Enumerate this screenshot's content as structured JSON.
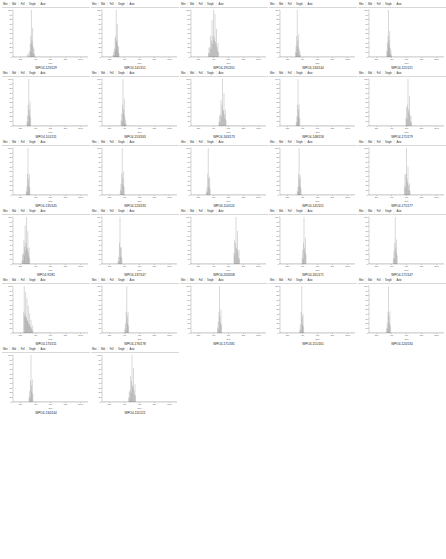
{
  "page": {
    "layout": "grid of mass-spectrum panels, 5 columns",
    "panel_count": 27
  },
  "toolbar": {
    "items": [
      "Mini",
      "Mid",
      "Full",
      "Single",
      "Auto"
    ],
    "separator": "|"
  },
  "axis": {
    "xlabel": "m/z",
    "ylabel": "",
    "ticks_x": [
      "200",
      "400",
      "600",
      "800",
      "1000"
    ]
  },
  "chart_data": [
    {
      "type": "line",
      "title": "WPO4-123/129",
      "xlabel": "m/z",
      "ylabel": "Intensity",
      "xlim": [
        100,
        1100
      ],
      "ylim": [
        0,
        100
      ],
      "yticks": [
        0,
        10,
        20,
        30,
        40,
        50,
        60,
        70,
        80,
        90,
        100
      ],
      "peaks": [
        {
          "x": 345,
          "y": 100
        },
        {
          "x": 362,
          "y": 62
        },
        {
          "x": 330,
          "y": 28
        },
        {
          "x": 380,
          "y": 18
        },
        {
          "x": 300,
          "y": 9
        }
      ]
    },
    {
      "type": "line",
      "title": "WPO4-141/151",
      "xlabel": "m/z",
      "ylabel": "Intensity",
      "xlim": [
        100,
        1100
      ],
      "ylim": [
        0,
        100
      ],
      "peaks": [
        {
          "x": 290,
          "y": 100
        },
        {
          "x": 305,
          "y": 70
        },
        {
          "x": 275,
          "y": 40
        },
        {
          "x": 320,
          "y": 22
        },
        {
          "x": 255,
          "y": 11
        }
      ]
    },
    {
      "type": "line",
      "title": "WPO4-191/201",
      "xlabel": "m/z",
      "ylabel": "Intensity",
      "xlim": [
        100,
        1100
      ],
      "ylim": [
        0,
        100
      ],
      "peaks": [
        {
          "x": 400,
          "y": 100
        },
        {
          "x": 420,
          "y": 92
        },
        {
          "x": 380,
          "y": 78
        },
        {
          "x": 440,
          "y": 60
        },
        {
          "x": 360,
          "y": 45
        },
        {
          "x": 460,
          "y": 30
        },
        {
          "x": 340,
          "y": 20
        }
      ]
    },
    {
      "type": "line",
      "title": "WPO4-134/144",
      "xlabel": "m/z",
      "ylabel": "Intensity",
      "xlim": [
        100,
        1100
      ],
      "ylim": [
        0,
        100
      ],
      "peaks": [
        {
          "x": 330,
          "y": 100
        },
        {
          "x": 348,
          "y": 48
        },
        {
          "x": 315,
          "y": 25
        },
        {
          "x": 365,
          "y": 12
        }
      ]
    },
    {
      "type": "line",
      "title": "WPO4-121/121",
      "xlabel": "m/z",
      "ylabel": "Intensity",
      "xlim": [
        100,
        1100
      ],
      "ylim": [
        0,
        100
      ],
      "peaks": [
        {
          "x": 360,
          "y": 100
        },
        {
          "x": 375,
          "y": 55
        },
        {
          "x": 345,
          "y": 30
        },
        {
          "x": 392,
          "y": 14
        }
      ]
    },
    {
      "type": "line",
      "title": "WPO4-101/111",
      "xlabel": "m/z",
      "ylabel": "Intensity",
      "xlim": [
        100,
        1100
      ],
      "ylim": [
        0,
        100
      ],
      "peaks": [
        {
          "x": 310,
          "y": 100
        },
        {
          "x": 328,
          "y": 52
        },
        {
          "x": 295,
          "y": 22
        }
      ]
    },
    {
      "type": "line",
      "title": "WPO4-153/163",
      "xlabel": "m/z",
      "ylabel": "Intensity",
      "xlim": [
        100,
        1100
      ],
      "ylim": [
        0,
        100
      ],
      "peaks": [
        {
          "x": 380,
          "y": 100
        },
        {
          "x": 398,
          "y": 58
        },
        {
          "x": 362,
          "y": 26
        },
        {
          "x": 415,
          "y": 12
        }
      ]
    },
    {
      "type": "line",
      "title": "WPO4-163/173",
      "xlabel": "m/z",
      "ylabel": "Intensity",
      "xlim": [
        100,
        1100
      ],
      "ylim": [
        0,
        100
      ],
      "peaks": [
        {
          "x": 520,
          "y": 100
        },
        {
          "x": 540,
          "y": 70
        },
        {
          "x": 500,
          "y": 55
        },
        {
          "x": 560,
          "y": 35
        },
        {
          "x": 480,
          "y": 22
        }
      ]
    },
    {
      "type": "line",
      "title": "WPO4-148/158",
      "xlabel": "m/z",
      "ylabel": "Intensity",
      "xlim": [
        100,
        1100
      ],
      "ylim": [
        0,
        100
      ],
      "peaks": [
        {
          "x": 340,
          "y": 100
        },
        {
          "x": 356,
          "y": 46
        },
        {
          "x": 324,
          "y": 20
        }
      ]
    },
    {
      "type": "line",
      "title": "WPO4-171/179",
      "xlabel": "m/z",
      "ylabel": "Intensity",
      "xlim": [
        100,
        1100
      ],
      "ylim": [
        0,
        100
      ],
      "peaks": [
        {
          "x": 620,
          "y": 100
        },
        {
          "x": 640,
          "y": 64
        },
        {
          "x": 600,
          "y": 40
        },
        {
          "x": 660,
          "y": 22
        }
      ]
    },
    {
      "type": "line",
      "title": "WPO4-135/145",
      "xlabel": "m/z",
      "ylabel": "Intensity",
      "xlim": [
        100,
        1100
      ],
      "ylim": [
        0,
        100
      ],
      "peaks": [
        {
          "x": 300,
          "y": 100
        },
        {
          "x": 318,
          "y": 44
        },
        {
          "x": 285,
          "y": 18
        }
      ]
    },
    {
      "type": "line",
      "title": "WPO4-123/133",
      "xlabel": "m/z",
      "ylabel": "Intensity",
      "xlim": [
        100,
        1100
      ],
      "ylim": [
        0,
        100
      ],
      "peaks": [
        {
          "x": 370,
          "y": 100
        },
        {
          "x": 388,
          "y": 50
        },
        {
          "x": 352,
          "y": 24
        }
      ]
    },
    {
      "type": "line",
      "title": "WPO4-114/124",
      "xlabel": "m/z",
      "ylabel": "Intensity",
      "xlim": [
        100,
        1100
      ],
      "ylim": [
        0,
        100
      ],
      "peaks": [
        {
          "x": 330,
          "y": 100
        },
        {
          "x": 348,
          "y": 38
        },
        {
          "x": 312,
          "y": 16
        }
      ]
    },
    {
      "type": "line",
      "title": "WPO4-141/151",
      "xlabel": "m/z",
      "ylabel": "Intensity",
      "xlim": [
        100,
        1100
      ],
      "ylim": [
        0,
        100
      ],
      "peaks": [
        {
          "x": 355,
          "y": 100
        },
        {
          "x": 372,
          "y": 42
        },
        {
          "x": 338,
          "y": 18
        }
      ]
    },
    {
      "type": "line",
      "title": "WPO4-171/177",
      "xlabel": "m/z",
      "ylabel": "Intensity",
      "xlim": [
        100,
        1100
      ],
      "ylim": [
        0,
        100
      ],
      "peaks": [
        {
          "x": 600,
          "y": 100
        },
        {
          "x": 620,
          "y": 60
        },
        {
          "x": 580,
          "y": 44
        },
        {
          "x": 640,
          "y": 25
        }
      ]
    },
    {
      "type": "line",
      "title": "WPO4-92/81",
      "xlabel": "m/z",
      "ylabel": "Intensity",
      "xlim": [
        100,
        1100
      ],
      "ylim": [
        0,
        100
      ],
      "peaks": [
        {
          "x": 280,
          "y": 100
        },
        {
          "x": 262,
          "y": 82
        },
        {
          "x": 298,
          "y": 70
        },
        {
          "x": 245,
          "y": 50
        },
        {
          "x": 315,
          "y": 35
        },
        {
          "x": 228,
          "y": 20
        }
      ]
    },
    {
      "type": "line",
      "title": "WPO4-137/147",
      "xlabel": "m/z",
      "ylabel": "Intensity",
      "xlim": [
        100,
        1100
      ],
      "ylim": [
        0,
        100
      ],
      "peaks": [
        {
          "x": 340,
          "y": 100
        },
        {
          "x": 358,
          "y": 36
        },
        {
          "x": 322,
          "y": 15
        }
      ]
    },
    {
      "type": "line",
      "title": "WPO4-203/208",
      "xlabel": "m/z",
      "ylabel": "Intensity",
      "xlim": [
        100,
        1100
      ],
      "ylim": [
        0,
        100
      ],
      "peaks": [
        {
          "x": 700,
          "y": 100
        },
        {
          "x": 720,
          "y": 70
        },
        {
          "x": 680,
          "y": 52
        },
        {
          "x": 740,
          "y": 30
        }
      ]
    },
    {
      "type": "line",
      "title": "WPO4-161/171",
      "xlabel": "m/z",
      "ylabel": "Intensity",
      "xlim": [
        100,
        1100
      ],
      "ylim": [
        0,
        100
      ],
      "peaks": [
        {
          "x": 420,
          "y": 100
        },
        {
          "x": 440,
          "y": 56
        },
        {
          "x": 402,
          "y": 30
        }
      ]
    },
    {
      "type": "line",
      "title": "WPO4-171/147",
      "xlabel": "m/z",
      "ylabel": "Intensity",
      "xlim": [
        100,
        1100
      ],
      "ylim": [
        0,
        100
      ],
      "peaks": [
        {
          "x": 450,
          "y": 100
        },
        {
          "x": 468,
          "y": 52
        },
        {
          "x": 432,
          "y": 28
        }
      ]
    },
    {
      "type": "line",
      "title": "WPO4-175/111",
      "xlabel": "m/z",
      "ylabel": "Intensity",
      "xlim": [
        100,
        1100
      ],
      "ylim": [
        0,
        100
      ],
      "peaks": [
        {
          "x": 250,
          "y": 100
        },
        {
          "x": 268,
          "y": 88
        },
        {
          "x": 286,
          "y": 74
        },
        {
          "x": 304,
          "y": 58
        },
        {
          "x": 322,
          "y": 42
        },
        {
          "x": 340,
          "y": 28
        },
        {
          "x": 358,
          "y": 16
        }
      ]
    },
    {
      "type": "line",
      "title": "WPO4-176/178",
      "xlabel": "m/z",
      "ylabel": "Intensity",
      "xlim": [
        100,
        1100
      ],
      "ylim": [
        0,
        100
      ],
      "peaks": [
        {
          "x": 430,
          "y": 100
        },
        {
          "x": 448,
          "y": 44
        },
        {
          "x": 412,
          "y": 20
        }
      ]
    },
    {
      "type": "line",
      "title": "WPO4-171/181",
      "xlabel": "m/z",
      "ylabel": "Intensity",
      "xlim": [
        100,
        1100
      ],
      "ylim": [
        0,
        100
      ],
      "peaks": [
        {
          "x": 480,
          "y": 100
        },
        {
          "x": 500,
          "y": 50
        },
        {
          "x": 462,
          "y": 24
        }
      ]
    },
    {
      "type": "line",
      "title": "WPO4-151/161",
      "xlabel": "m/z",
      "ylabel": "Intensity",
      "xlim": [
        100,
        1100
      ],
      "ylim": [
        0,
        100
      ],
      "peaks": [
        {
          "x": 390,
          "y": 100
        },
        {
          "x": 408,
          "y": 40
        },
        {
          "x": 372,
          "y": 18
        }
      ]
    },
    {
      "type": "line",
      "title": "WPO4-124/134",
      "xlabel": "m/z",
      "ylabel": "Intensity",
      "xlim": [
        100,
        1100
      ],
      "ylim": [
        0,
        100
      ],
      "peaks": [
        {
          "x": 360,
          "y": 100
        },
        {
          "x": 378,
          "y": 46
        },
        {
          "x": 342,
          "y": 22
        }
      ]
    },
    {
      "type": "line",
      "title": "WPO4-134/144",
      "xlabel": "m/z",
      "ylabel": "Intensity",
      "xlim": [
        100,
        1100
      ],
      "ylim": [
        0,
        100
      ],
      "peaks": [
        {
          "x": 340,
          "y": 100
        },
        {
          "x": 358,
          "y": 48
        },
        {
          "x": 322,
          "y": 24
        }
      ]
    },
    {
      "type": "line",
      "title": "WPO4-111/121",
      "xlabel": "m/z",
      "ylabel": "Intensity",
      "xlim": [
        100,
        1100
      ],
      "ylim": [
        0,
        100
      ],
      "peaks": [
        {
          "x": 500,
          "y": 100
        },
        {
          "x": 520,
          "y": 72
        },
        {
          "x": 482,
          "y": 55
        },
        {
          "x": 540,
          "y": 38
        },
        {
          "x": 464,
          "y": 22
        }
      ]
    }
  ]
}
